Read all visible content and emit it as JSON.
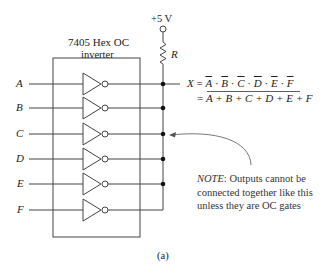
{
  "chip": {
    "title_line1": "7405 Hex OC",
    "title_line2": "inverter"
  },
  "supply": {
    "label": "+5 V",
    "resistor_label": "R"
  },
  "inputs": [
    {
      "label": "A"
    },
    {
      "label": "B"
    },
    {
      "label": "C"
    },
    {
      "label": "D"
    },
    {
      "label": "E"
    },
    {
      "label": "F"
    }
  ],
  "equation": {
    "lhs": "X",
    "eq1": "=",
    "line1_terms": [
      "A",
      "B",
      "C",
      "D",
      "E",
      "F"
    ],
    "line1_op": "·",
    "eq2": "=",
    "line2_expr": "A + B + C + D + E + F"
  },
  "note": {
    "prefix": "NOTE",
    "line1_rest": ": Outputs cannot be",
    "line2": "connected together like this",
    "line3": "unless they are OC gates"
  },
  "caption": "(a)"
}
